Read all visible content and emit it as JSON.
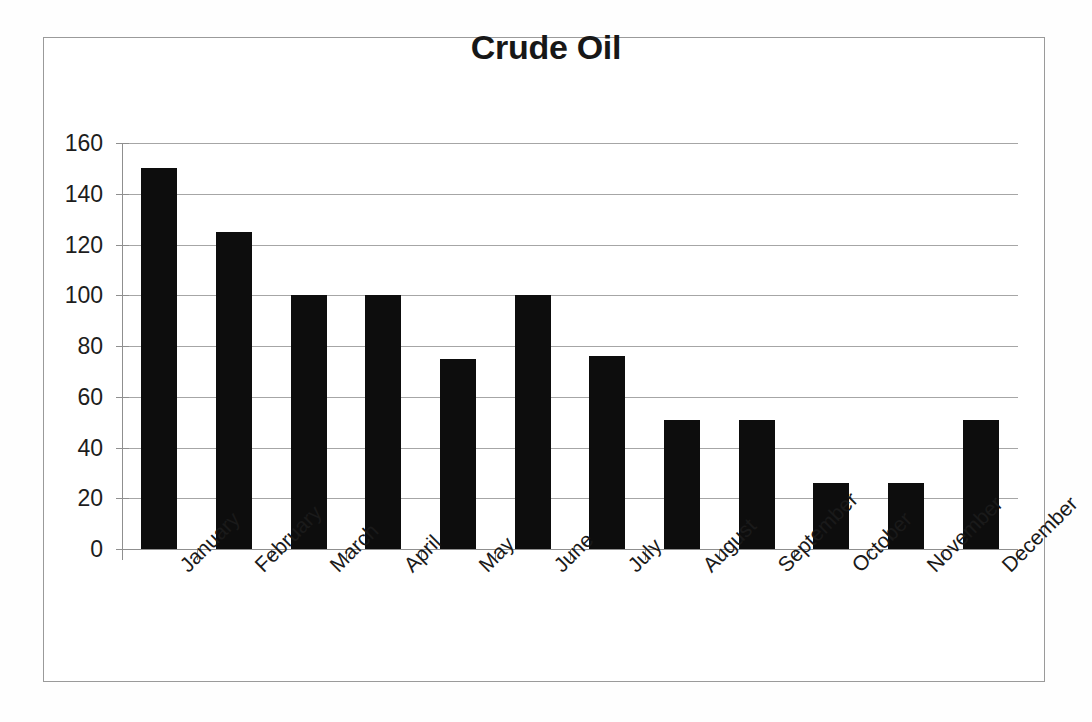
{
  "chart_data": {
    "type": "bar",
    "title": "Crude Oil",
    "xlabel": "",
    "ylabel": "",
    "ylim": [
      0,
      160
    ],
    "ytick_step": 20,
    "yticks": [
      160,
      140,
      120,
      100,
      80,
      60,
      40,
      20,
      0
    ],
    "grid": true,
    "legend": false,
    "bar_color": "#0d0d0d",
    "categories": [
      "January",
      "February",
      "March",
      "April",
      "May",
      "June",
      "July",
      "August",
      "September",
      "October",
      "November",
      "December"
    ],
    "values": [
      150,
      125,
      100,
      100,
      75,
      100,
      76,
      51,
      51,
      26,
      26,
      51
    ]
  }
}
